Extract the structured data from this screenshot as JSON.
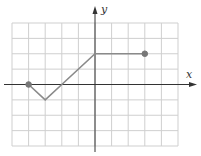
{
  "chart_data": {
    "type": "line",
    "title": "",
    "xlabel": "x",
    "ylabel": "y",
    "xlim": [
      -5,
      5
    ],
    "ylim": [
      -4,
      4
    ],
    "grid": true,
    "grid_step": 1,
    "tick_labels": false,
    "series": [
      {
        "name": "f",
        "points": [
          [
            -4,
            0
          ],
          [
            -3,
            -1
          ],
          [
            -2,
            0
          ],
          [
            0,
            2
          ],
          [
            3,
            2
          ]
        ],
        "endpoints": [
          {
            "x": -4,
            "y": 0,
            "filled": true
          },
          {
            "x": 3,
            "y": 2,
            "filled": true
          }
        ]
      }
    ]
  },
  "labels": {
    "x_axis": "x",
    "y_axis": "y"
  },
  "colors": {
    "grid": "#cfcfcf",
    "axis": "#333333",
    "line": "#8a8a8a",
    "dot": "#777777"
  }
}
